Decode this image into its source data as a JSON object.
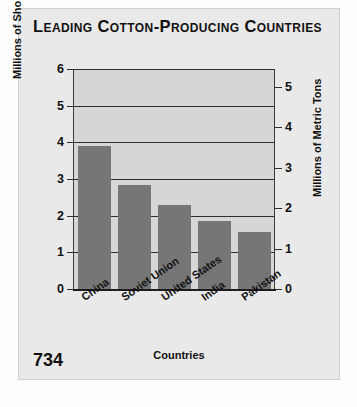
{
  "page": {
    "number": "734"
  },
  "title": "Leading Cotton-Producing Countries",
  "chart_data": {
    "type": "bar",
    "title": "Leading Cotton-Producing Countries",
    "xlabel": "Countries",
    "ylabel": "Millions of Short Tons",
    "ylabel_secondary": "Millions of Metric Tons",
    "categories": [
      "China",
      "Soviet Union",
      "United States",
      "India",
      "Pakistan"
    ],
    "values": [
      3.9,
      2.85,
      2.3,
      1.85,
      1.55
    ],
    "ylim": [
      0,
      6
    ],
    "yticks": [
      0,
      1,
      2,
      3,
      4,
      5,
      6
    ],
    "ylim_secondary": [
      0,
      5.44
    ],
    "yticks_secondary": [
      0,
      1,
      2,
      3,
      4,
      5
    ],
    "grid": true,
    "legend": "none",
    "bar_color": "#767676",
    "plot_background": "#d6d6d6",
    "axis_color": "#2e2e2e"
  }
}
